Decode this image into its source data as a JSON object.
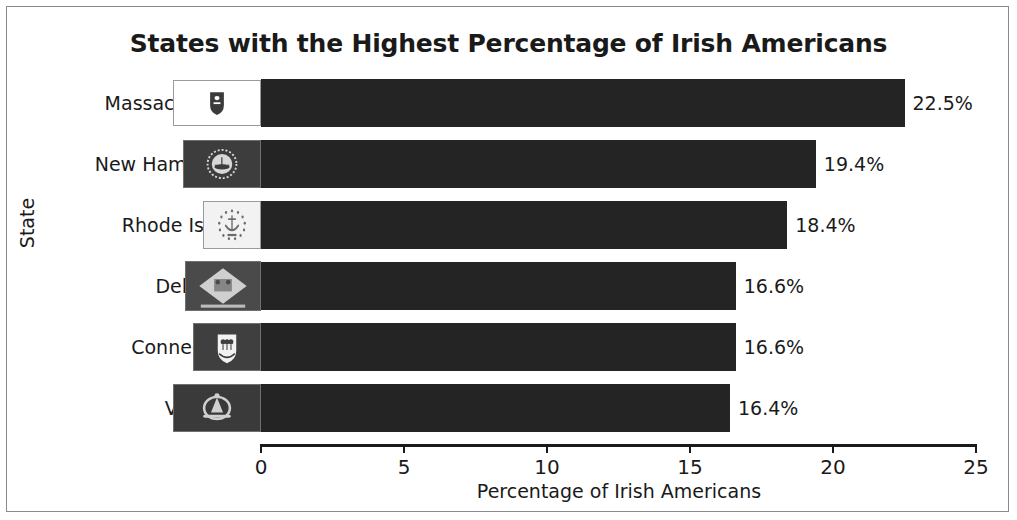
{
  "chart_data": {
    "type": "bar",
    "orientation": "horizontal",
    "title": "States with the Highest Percentage of Irish Americans",
    "xlabel": "Percentage of Irish Americans",
    "ylabel": "State",
    "categories": [
      "Massachusetts",
      "New Hampshire",
      "Rhode Island",
      "Delaware",
      "Connecticut",
      "Vermont"
    ],
    "values": [
      22.5,
      19.4,
      18.4,
      16.6,
      16.6,
      16.4
    ],
    "value_labels": [
      "22.5%",
      "19.4%",
      "18.4%",
      "16.6%",
      "16.6%",
      "16.4%"
    ],
    "xlim": [
      0,
      25
    ],
    "xticks": [
      0,
      5,
      10,
      15,
      20,
      25
    ],
    "xtick_labels": [
      "0",
      "5",
      "10",
      "15",
      "20",
      "25"
    ],
    "grid": false,
    "legend": null,
    "bar_color": "#242424",
    "background_color": "#ffffff",
    "text_color": "#1a1a1a"
  },
  "bars": [
    {
      "label": "Massachusetts",
      "value": 22.5,
      "value_label": "22.5%",
      "flag_icon": "flag-massachusetts",
      "flag_field": "#ffffff",
      "flag_emblem": "#3b3b3b",
      "flag_width": 88,
      "flag_height": 46,
      "flag_border": "#9a9a9a"
    },
    {
      "label": "New Hampshire",
      "value": 19.4,
      "value_label": "19.4%",
      "flag_icon": "flag-new-hampshire",
      "flag_field": "#3d3d3d",
      "flag_emblem": "#d8d8d8",
      "flag_width": 78,
      "flag_height": 48,
      "flag_border": "#6f6f6f"
    },
    {
      "label": "Rhode Island",
      "value": 18.4,
      "value_label": "18.4%",
      "flag_icon": "flag-rhode-island",
      "flag_field": "#f2f2f2",
      "flag_emblem": "#6a6a6a",
      "flag_width": 58,
      "flag_height": 48,
      "flag_border": "#9a9a9a"
    },
    {
      "label": "Delaware",
      "value": 16.6,
      "value_label": "16.6%",
      "flag_icon": "flag-delaware",
      "flag_field": "#4a4a4a",
      "flag_emblem": "#cfcfcf",
      "flag_width": 76,
      "flag_height": 50,
      "flag_border": "#6f6f6f"
    },
    {
      "label": "Connecticut",
      "value": 16.6,
      "value_label": "16.6%",
      "flag_icon": "flag-connecticut",
      "flag_field": "#3f3f3f",
      "flag_emblem": "#f2f2f2",
      "flag_width": 68,
      "flag_height": 48,
      "flag_border": "#6f6f6f"
    },
    {
      "label": "Vermont",
      "value": 16.4,
      "value_label": "16.4%",
      "flag_icon": "flag-vermont",
      "flag_field": "#3a3a3a",
      "flag_emblem": "#d0d0d0",
      "flag_width": 88,
      "flag_height": 48,
      "flag_border": "#6f6f6f"
    }
  ]
}
